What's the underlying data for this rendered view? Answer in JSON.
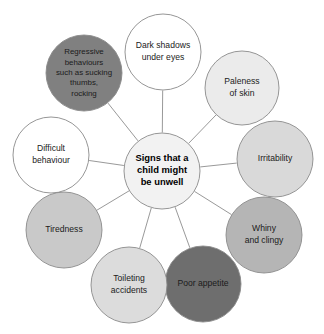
{
  "diagram": {
    "type": "radial-mind-map",
    "background_color": "#ffffff",
    "stroke_color": "#8a8a8a",
    "spoke_color": "#8d8d8d",
    "center": {
      "label_lines": [
        "Signs that a",
        "child might",
        "be unwell"
      ],
      "full_label": "Signs that a child might be unwell",
      "fill": "#f2f2f2",
      "cx": 162,
      "cy": 171,
      "r": 38
    },
    "nodes": [
      {
        "id": "dark-shadows-under-eyes",
        "full_label": "Dark shadows under eyes",
        "label_lines": [
          "Dark shadows",
          "under eyes"
        ],
        "fill": "#ffffff",
        "cx": 163,
        "cy": 52,
        "r": 38
      },
      {
        "id": "paleness-of-skin",
        "full_label": "Paleness of skin",
        "label_lines": [
          "Paleness",
          "of skin"
        ],
        "fill": "#ebebeb",
        "cx": 242,
        "cy": 88,
        "r": 37
      },
      {
        "id": "irritability",
        "full_label": "Irritability",
        "label_lines": [
          "Irritability"
        ],
        "fill": "#d9d9d9",
        "cx": 275,
        "cy": 159,
        "r": 38
      },
      {
        "id": "whiny-and-clingy",
        "full_label": "Whiny and clingy",
        "label_lines": [
          "Whiny",
          "and clingy"
        ],
        "fill": "#b5b5b5",
        "cx": 264,
        "cy": 235,
        "r": 38
      },
      {
        "id": "poor-appetite",
        "full_label": "Poor appetite",
        "label_lines": [
          "Poor appetite"
        ],
        "fill": "#6e6e6e",
        "cx": 203,
        "cy": 284,
        "r": 38
      },
      {
        "id": "toileting-accidents",
        "full_label": "Toileting accidents",
        "label_lines": [
          "Toileting",
          "accidents"
        ],
        "fill": "#dcdcdc",
        "cx": 129,
        "cy": 285,
        "r": 38
      },
      {
        "id": "tiredness",
        "full_label": "Tiredness",
        "label_lines": [
          "Tiredness"
        ],
        "fill": "#c9c9c9",
        "cx": 64,
        "cy": 230,
        "r": 38
      },
      {
        "id": "difficult-behaviour",
        "full_label": "Difficult behaviour",
        "label_lines": [
          "Difficult",
          "behaviour"
        ],
        "fill": "#ffffff",
        "cx": 51,
        "cy": 155,
        "r": 38
      },
      {
        "id": "regressive-behaviours",
        "full_label": "Regressive behaviours such as sucking thumbs, rocking",
        "label_lines": [
          "Regressive",
          "behaviours",
          "such as sucking",
          "thumbs,",
          "rocking"
        ],
        "fill": "#808080",
        "cx": 84,
        "cy": 73,
        "r": 38
      }
    ]
  }
}
